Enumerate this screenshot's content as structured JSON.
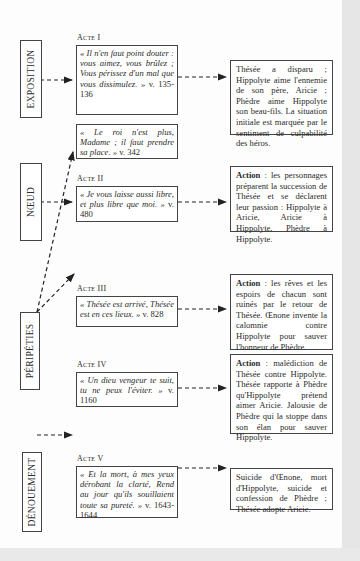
{
  "stages": [
    {
      "id": "exposition",
      "label": "EXPOSITION"
    },
    {
      "id": "noeud",
      "label": "NŒUD"
    },
    {
      "id": "peripeties",
      "label": "PÉRIPÉTIES"
    },
    {
      "id": "denouement",
      "label": "DÉNOUEMENT"
    }
  ],
  "acts": [
    {
      "label": "Acte I",
      "quotes": [
        {
          "text": "« Il n'en faut point douter : vous aimez, vous brûlez ; Vous périssez d'un mal que vous dissimulez. »",
          "ref": "v. 135-136"
        },
        {
          "text": "« Le roi n'est plus, Madame ; il faut prendre sa place. »",
          "ref": "v. 342"
        }
      ],
      "summary": {
        "bold": "",
        "text": "Thésée a disparu ; Hippolyte aime l'ennemie de son père, Aricie ; Phèdre aime Hippolyte son beau-fils. La situation initiale est marquée par le sentiment de culpabilité des héros."
      }
    },
    {
      "label": "Acte II",
      "quotes": [
        {
          "text": "« Je vous laisse aussi libre, et plus libre que moi. »",
          "ref": "v. 480"
        }
      ],
      "summary": {
        "bold": "Action",
        "text": " : les personnages préparent la succession de Thésée et se déclarent leur passion : Hippolyte à Aricie, Aricie à Hippolyte, Phèdre à Hippolyte."
      }
    },
    {
      "label": "Acte III",
      "quotes": [
        {
          "text": "« Thésée est arrivé, Thésée est en ces lieux. »",
          "ref": "v. 828"
        }
      ],
      "summary": {
        "bold": "Action",
        "text": " : les rêves et les espoirs de chacun sont ruinés par le retour de Thésée. Œnone invente la calomnie contre Hippolyte pour sauver l'honneur de Phèdre."
      }
    },
    {
      "label": "Acte IV",
      "quotes": [
        {
          "text": "« Un dieu vengeur te suit, tu ne peux l'éviter. »",
          "ref": "v. 1160"
        }
      ],
      "summary": {
        "bold": "Action",
        "text": " : malédiction de Thésée contre Hippolyte. Thésée rapporte à Phèdre qu'Hippolyte prétend aimer Aricie. Jalousie de Phèdre qui la stoppe dans son élan pour sauver Hippolyte."
      }
    },
    {
      "label": "Acte V",
      "quotes": [
        {
          "text": "« Et la mort, à mes yeux dérobant la clarté, Rend au jour qu'ils souillaient toute sa pureté. »",
          "ref": "v. 1643-1644"
        }
      ],
      "summary": {
        "bold": "",
        "text": "Suicide d'Œnone, mort d'Hippolyte, suicide et confession de Phèdre ; Thésée adopte Aricie."
      }
    }
  ],
  "colors": {
    "page": "#fdfdfd",
    "margin": "#e6e6e6",
    "line": "#222222"
  }
}
